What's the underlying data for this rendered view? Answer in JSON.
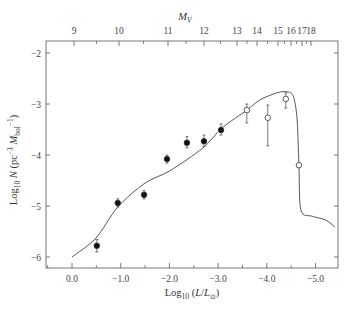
{
  "chart_data": {
    "type": "scatter",
    "title": "",
    "xlabel": "Log10 (L/L⊙)",
    "ylabel": "Log10 N (pc^-3 M_bol^-1)",
    "top_axis_label": "M_V",
    "xlim": [
      0.53,
      -5.47
    ],
    "ylim": [
      -6.25,
      -1.75
    ],
    "x_ticks": [
      0.0,
      -1.0,
      -2.0,
      -3.0,
      -4.0,
      -5.0
    ],
    "x_tick_labels": [
      "0.0",
      "−1.0",
      "−2.0",
      "−3.0",
      "−4.0",
      "−5.0"
    ],
    "y_ticks": [
      -2,
      -3,
      -4,
      -5,
      -6
    ],
    "y_tick_labels": [
      "−2",
      "−3",
      "−4",
      "−5",
      "−6"
    ],
    "top_ticks": [
      {
        "label": "9",
        "px": 74
      },
      {
        "label": "10",
        "px": 119
      },
      {
        "label": "11",
        "px": 168
      },
      {
        "label": "12",
        "px": 204
      },
      {
        "label": "13",
        "px": 237
      },
      {
        "label": "14",
        "px": 257
      },
      {
        "label": "15",
        "px": 278
      },
      {
        "label": "16",
        "px": 291
      },
      {
        "label": "17",
        "px": 302
      },
      {
        "label": "18",
        "px": 311
      }
    ],
    "grid": false,
    "legend": null,
    "series": [
      {
        "name": "Observed (filled)",
        "marker": "filled-circle",
        "points": [
          {
            "x": -0.51,
            "y": -5.78,
            "err_lo": 0.12,
            "err_hi": 0.12
          },
          {
            "x": -0.94,
            "y": -4.94,
            "err_lo": 0.08,
            "err_hi": 0.08
          },
          {
            "x": -1.48,
            "y": -4.78,
            "err_lo": 0.08,
            "err_hi": 0.08
          },
          {
            "x": -1.95,
            "y": -4.08,
            "err_lo": 0.08,
            "err_hi": 0.08
          },
          {
            "x": -2.36,
            "y": -3.76,
            "err_lo": 0.1,
            "err_hi": 0.12
          },
          {
            "x": -2.71,
            "y": -3.73,
            "err_lo": 0.1,
            "err_hi": 0.12
          },
          {
            "x": -3.06,
            "y": -3.51,
            "err_lo": 0.1,
            "err_hi": 0.12
          }
        ]
      },
      {
        "name": "Observed (open)",
        "marker": "open-circle",
        "points": [
          {
            "x": -3.59,
            "y": -3.12,
            "err_lo": 0.25,
            "err_hi": 0.12
          },
          {
            "x": -4.02,
            "y": -3.27,
            "err_lo": 0.55,
            "err_hi": 0.25
          },
          {
            "x": -4.39,
            "y": -2.9,
            "err_lo": 0.18,
            "err_hi": 0.12
          },
          {
            "x": -4.66,
            "y": -4.2,
            "err_lo": 0.0,
            "err_hi": 0.0
          }
        ]
      },
      {
        "name": "Model curve",
        "type": "line",
        "x": [
          0.0,
          -0.49,
          -0.94,
          -1.5,
          -2.01,
          -2.69,
          -3.08,
          -3.59,
          -3.86,
          -4.21,
          -4.41,
          -4.54,
          -4.62,
          -4.66,
          -4.7,
          -4.93,
          -5.2,
          -5.4
        ],
        "y": [
          -6.0,
          -5.63,
          -5.02,
          -4.55,
          -4.31,
          -3.86,
          -3.47,
          -3.12,
          -2.92,
          -2.78,
          -2.76,
          -2.84,
          -3.27,
          -4.2,
          -5.08,
          -5.2,
          -5.27,
          -5.41
        ]
      }
    ]
  },
  "layout": {
    "frame": {
      "left": 46,
      "top": 41,
      "right": 338,
      "bottom": 268
    },
    "x_px_at_zero": 72,
    "x_px_per_unit": 48.7,
    "y_px_at_minus2": 53,
    "y_px_per_unit": 51
  }
}
